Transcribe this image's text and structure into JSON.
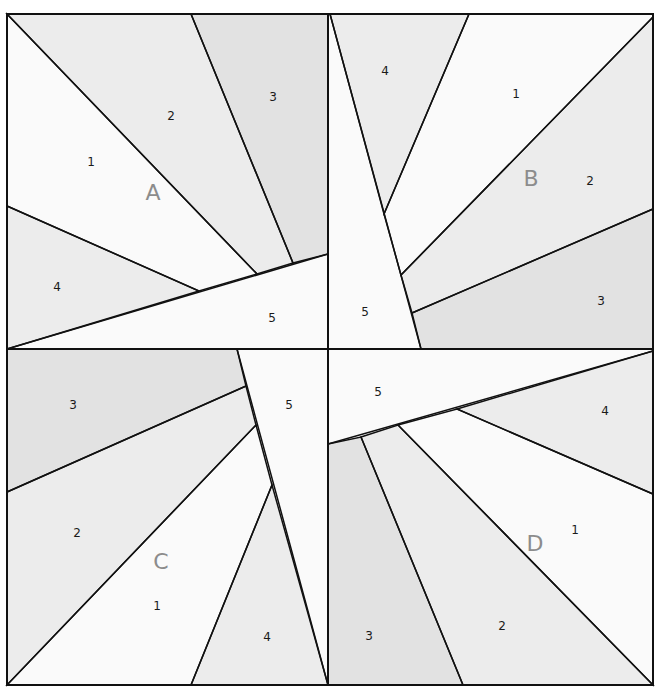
{
  "diagram": {
    "type": "quilt-block-pattern",
    "colors": {
      "light": "#fafafa",
      "medium": "#ececec",
      "dark": "#e2e2e2",
      "line": "#111111",
      "block_label": "#8c8c8c"
    },
    "blocks": [
      {
        "id": "A",
        "label": "A",
        "label_pos": [
          153,
          200
        ],
        "pieces": [
          {
            "num": "1",
            "shade": "light",
            "label_pos": [
              91,
              166
            ],
            "points": [
              [
                7,
                14
              ],
              [
                257,
                274
              ],
              [
                199,
                291
              ],
              [
                7,
                206
              ]
            ]
          },
          {
            "num": "2",
            "shade": "medium",
            "label_pos": [
              171,
              120
            ],
            "points": [
              [
                7,
                14
              ],
              [
                191,
                14
              ],
              [
                293,
                263
              ],
              [
                257,
                274
              ]
            ]
          },
          {
            "num": "3",
            "shade": "dark",
            "label_pos": [
              273,
              101
            ],
            "points": [
              [
                191,
                14
              ],
              [
                328,
                14
              ],
              [
                328,
                254
              ],
              [
                293,
                263
              ]
            ]
          },
          {
            "num": "4",
            "shade": "medium",
            "label_pos": [
              57,
              291
            ],
            "points": [
              [
                7,
                206
              ],
              [
                199,
                291
              ],
              [
                7,
                349
              ]
            ]
          },
          {
            "num": "5",
            "shade": "light",
            "label_pos": [
              272,
              322
            ],
            "points": [
              [
                7,
                349
              ],
              [
                328,
                254
              ],
              [
                328,
                349
              ]
            ]
          }
        ]
      },
      {
        "id": "B",
        "label": "B",
        "label_pos": [
          531,
          186
        ],
        "pieces": [
          {
            "num": "1",
            "shade": "light",
            "label_pos": [
              516,
              98
            ],
            "points": [
              [
                469,
                14
              ],
              [
                653,
                14
              ],
              [
                653,
                17
              ],
              [
                401,
                275
              ],
              [
                384,
                214
              ]
            ]
          },
          {
            "num": "2",
            "shade": "medium",
            "label_pos": [
              590,
              185
            ],
            "points": [
              [
                653,
                17
              ],
              [
                653,
                209
              ],
              [
                412,
                313
              ],
              [
                401,
                275
              ]
            ]
          },
          {
            "num": "3",
            "shade": "dark",
            "label_pos": [
              601,
              305
            ],
            "points": [
              [
                653,
                209
              ],
              [
                653,
                349
              ],
              [
                421,
                349
              ],
              [
                412,
                313
              ]
            ]
          },
          {
            "num": "4",
            "shade": "medium",
            "label_pos": [
              385,
              75
            ],
            "points": [
              [
                330,
                14
              ],
              [
                469,
                14
              ],
              [
                384,
                214
              ]
            ]
          },
          {
            "num": "5",
            "shade": "light",
            "label_pos": [
              365,
              316
            ],
            "points": [
              [
                328,
                14
              ],
              [
                330,
                14
              ],
              [
                421,
                349
              ],
              [
                328,
                349
              ]
            ]
          }
        ]
      },
      {
        "id": "C",
        "label": "C",
        "label_pos": [
          161,
          569
        ],
        "pieces": [
          {
            "num": "1",
            "shade": "light",
            "label_pos": [
              157,
              610
            ],
            "points": [
              [
                256,
                425
              ],
              [
                272,
                485
              ],
              [
                191,
                685
              ],
              [
                7,
                685
              ]
            ]
          },
          {
            "num": "2",
            "shade": "medium",
            "label_pos": [
              77,
              537
            ],
            "points": [
              [
                7,
                492
              ],
              [
                246,
                386
              ],
              [
                256,
                425
              ],
              [
                7,
                685
              ]
            ]
          },
          {
            "num": "3",
            "shade": "dark",
            "label_pos": [
              73,
              409
            ],
            "points": [
              [
                7,
                349
              ],
              [
                237,
                349
              ],
              [
                246,
                386
              ],
              [
                7,
                492
              ]
            ]
          },
          {
            "num": "4",
            "shade": "medium",
            "label_pos": [
              267,
              641
            ],
            "points": [
              [
                272,
                485
              ],
              [
                328,
                685
              ],
              [
                191,
                685
              ]
            ]
          },
          {
            "num": "5",
            "shade": "light",
            "label_pos": [
              289,
              409
            ],
            "points": [
              [
                237,
                349
              ],
              [
                328,
                349
              ],
              [
                328,
                685
              ]
            ]
          }
        ]
      },
      {
        "id": "D",
        "label": "D",
        "label_pos": [
          535,
          551
        ],
        "pieces": [
          {
            "num": "1",
            "shade": "light",
            "label_pos": [
              575,
              534
            ],
            "points": [
              [
                398,
                425
              ],
              [
                457,
                409
              ],
              [
                653,
                494
              ],
              [
                653,
                685
              ]
            ]
          },
          {
            "num": "2",
            "shade": "medium",
            "label_pos": [
              502,
              630
            ],
            "points": [
              [
                361,
                437
              ],
              [
                398,
                425
              ],
              [
                653,
                685
              ],
              [
                463,
                685
              ]
            ]
          },
          {
            "num": "3",
            "shade": "dark",
            "label_pos": [
              369,
              640
            ],
            "points": [
              [
                328,
                444
              ],
              [
                361,
                437
              ],
              [
                463,
                685
              ],
              [
                328,
                685
              ]
            ]
          },
          {
            "num": "4",
            "shade": "medium",
            "label_pos": [
              605,
              415
            ],
            "points": [
              [
                457,
                409
              ],
              [
                653,
                351
              ],
              [
                653,
                494
              ]
            ]
          },
          {
            "num": "5",
            "shade": "light",
            "label_pos": [
              378,
              396
            ],
            "points": [
              [
                328,
                349
              ],
              [
                653,
                349
              ],
              [
                653,
                351
              ],
              [
                328,
                444
              ]
            ]
          }
        ]
      }
    ],
    "outer_frame": [
      7,
      14,
      653,
      685
    ],
    "center_cross": {
      "x": 328,
      "y": 349
    }
  }
}
